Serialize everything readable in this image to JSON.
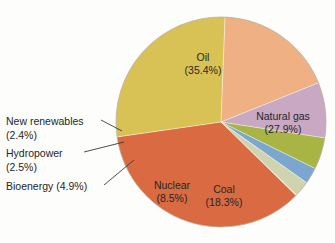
{
  "chart_data": {
    "type": "pie",
    "title": "",
    "subtitle": "",
    "xlabel": "",
    "ylabel": "",
    "legend_position": "none",
    "grid": false,
    "units": "percent",
    "total": 100.0,
    "categories": [
      "Oil",
      "Natural gas",
      "Coal",
      "Nuclear",
      "Bioenergy",
      "Hydropower",
      "New renewables"
    ],
    "values": [
      35.4,
      27.9,
      18.3,
      8.5,
      4.9,
      2.5,
      2.4
    ],
    "slices": [
      {
        "name": "Oil",
        "label": "Oil",
        "value": 35.4,
        "value_text": "(35.4%)",
        "color": "#d96a42",
        "label_placement": "inside",
        "label_x": 203,
        "label_y": 58,
        "start_angle": 134.4,
        "sweep": 127.4
      },
      {
        "name": "Natural gas",
        "label": "Natural gas",
        "value": 27.9,
        "value_text": "(27.9%)",
        "color": "#d8c255",
        "label_placement": "inside",
        "label_x": 283,
        "label_y": 117,
        "start_angle": 261.8,
        "sweep": 100.4
      },
      {
        "name": "Coal",
        "label": "Coal",
        "value": 18.3,
        "value_text": "(18.3%)",
        "color": "#efb084",
        "label_placement": "inside",
        "label_x": 224,
        "label_y": 190,
        "start_angle": 2.2,
        "sweep": 65.9
      },
      {
        "name": "Nuclear",
        "label": "Nuclear",
        "value": 8.5,
        "value_text": "(8.5%)",
        "color": "#c9a8c4",
        "label_placement": "inside",
        "label_x": 172,
        "label_y": 186,
        "start_angle": 68.1,
        "sweep": 30.6
      },
      {
        "name": "Bioenergy",
        "label": "Bioenergy (4.9%)",
        "value": 4.9,
        "value_text": "(4.9%)",
        "color": "#a8b444",
        "label_placement": "callout",
        "start_angle": 98.7,
        "sweep": 17.6
      },
      {
        "name": "Hydropower",
        "label": "Hydropower",
        "value": 2.5,
        "value_text": "(2.5%)",
        "color": "#7ba7cf",
        "label_placement": "callout",
        "start_angle": 116.3,
        "sweep": 9.0
      },
      {
        "name": "New renewables",
        "label": "New renewables",
        "value": 2.4,
        "value_text": "(2.4%)",
        "color": "#cfd4ae",
        "label_placement": "callout",
        "start_angle": 125.3,
        "sweep": 8.6
      }
    ],
    "geometry": {
      "center_x": 221,
      "center_y": 122,
      "radius": 105
    },
    "callouts": [
      {
        "name": "new-renewables",
        "line1": "New renewables",
        "line2": "(2.4%)",
        "text_x": 6,
        "text_y1": 122,
        "text_y2": 136,
        "leader": "M 101,120 L 122,131"
      },
      {
        "name": "hydropower",
        "line1": "Hydropower",
        "line2": "(2.5%)",
        "text_x": 6,
        "text_y1": 154,
        "text_y2": 168,
        "leader": "M 84,152 L 124,142"
      },
      {
        "name": "bioenergy",
        "line1": "Bioenergy (4.9%)",
        "line2": "",
        "text_x": 6,
        "text_y1": 187,
        "text_y2": 0,
        "leader": "M 104,185 L 134,160"
      }
    ]
  },
  "page": {
    "background_color": "#fdfdfc",
    "text_color": "#262626"
  }
}
